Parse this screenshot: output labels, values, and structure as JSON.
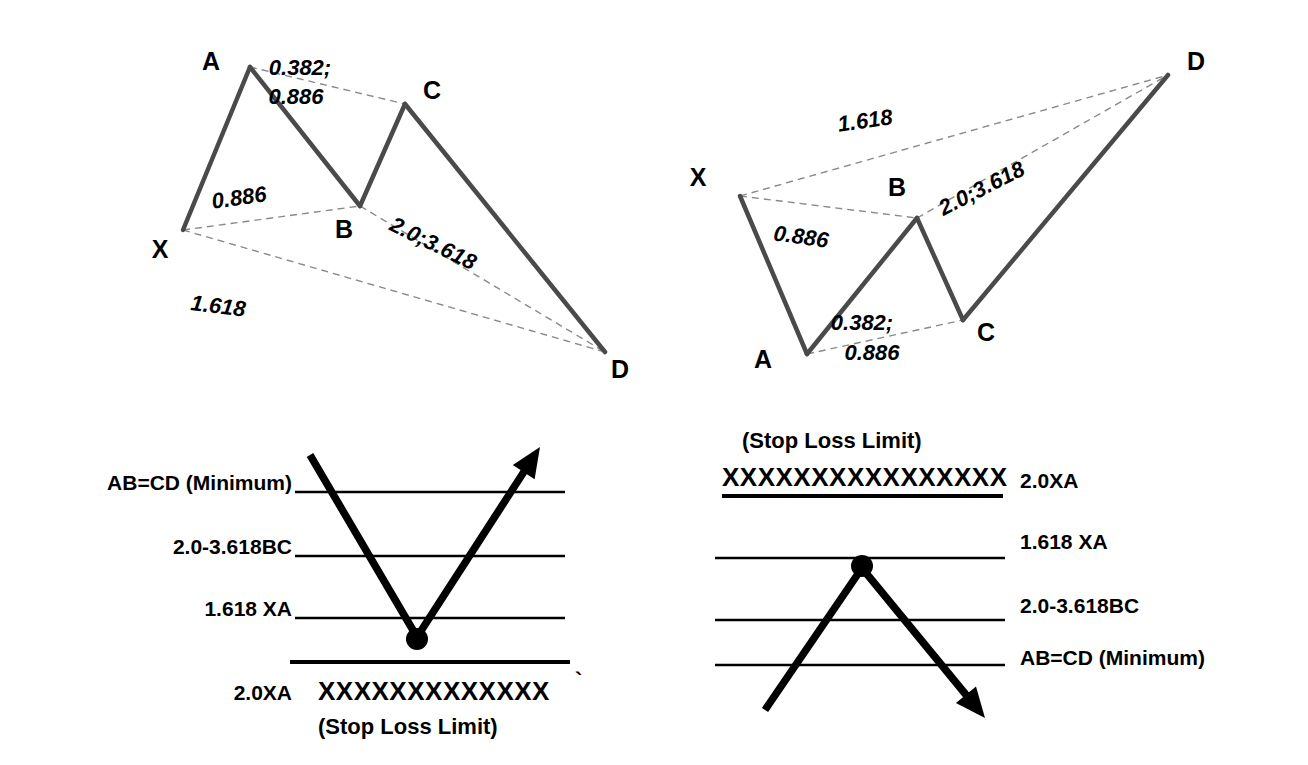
{
  "figure": {
    "background_color": "#ffffff",
    "ink_color": "#000000",
    "leg_color": "#4a4a4a",
    "projection_color": "#8a8a8a"
  },
  "patterns": {
    "bullish": {
      "name": "bullish-xabcd-pattern",
      "vertices": [
        {
          "id": "X",
          "label": "X",
          "x": 183,
          "y": 230,
          "label_x": 160,
          "label_y": 258
        },
        {
          "id": "A",
          "label": "A",
          "x": 250,
          "y": 67,
          "label_x": 211,
          "label_y": 70
        },
        {
          "id": "B",
          "label": "B",
          "x": 360,
          "y": 206,
          "label_x": 344,
          "label_y": 238
        },
        {
          "id": "C",
          "label": "C",
          "x": 405,
          "y": 104,
          "label_x": 432,
          "label_y": 99
        },
        {
          "id": "D",
          "label": "D",
          "x": 605,
          "y": 352,
          "label_x": 620,
          "label_y": 378
        }
      ],
      "ratios": [
        {
          "id": "AC",
          "text_line1": "0.382;",
          "text_line2": "0.886",
          "x": 300,
          "y": 75,
          "x2": 296,
          "y2": 104,
          "rotation": 0
        },
        {
          "id": "XB",
          "text_line1": "0.886",
          "text_line2": "",
          "x": 240,
          "y": 205,
          "x2": 0,
          "y2": 0,
          "rotation": -8
        },
        {
          "id": "BD",
          "text_line1": "2.0;3.618",
          "text_line2": "",
          "x": 430,
          "y": 250,
          "x2": 0,
          "y2": 0,
          "rotation": 26
        },
        {
          "id": "XD",
          "text_line1": "1.618",
          "text_line2": "",
          "x": 190,
          "y": 310,
          "x2": 0,
          "y2": 0,
          "rotation": 7
        }
      ]
    },
    "bearish": {
      "name": "bearish-xabcd-pattern",
      "vertices": [
        {
          "id": "X",
          "label": "X",
          "x": 740,
          "y": 196,
          "label_x": 698,
          "label_y": 186
        },
        {
          "id": "A",
          "label": "A",
          "x": 807,
          "y": 354,
          "label_x": 763,
          "label_y": 368
        },
        {
          "id": "B",
          "label": "B",
          "x": 917,
          "y": 218,
          "label_x": 897,
          "label_y": 196
        },
        {
          "id": "C",
          "label": "C",
          "x": 963,
          "y": 320,
          "label_x": 986,
          "label_y": 341
        },
        {
          "id": "D",
          "label": "D",
          "x": 1168,
          "y": 75,
          "label_x": 1196,
          "label_y": 70
        }
      ],
      "ratios": [
        {
          "id": "XD",
          "text_line1": "1.618",
          "text_line2": "",
          "x": 866,
          "y": 128,
          "x2": 0,
          "y2": 0,
          "rotation": -8
        },
        {
          "id": "XB",
          "text_line1": "0.886",
          "text_line2": "",
          "x": 800,
          "y": 244,
          "x2": 0,
          "y2": 0,
          "rotation": 8
        },
        {
          "id": "BD",
          "text_line1": "2.0;3.618",
          "text_line2": "",
          "x": 985,
          "y": 195,
          "x2": 0,
          "y2": 0,
          "rotation": -27
        },
        {
          "id": "AC",
          "text_line1": "0.382;",
          "text_line2": "0.886",
          "x": 862,
          "y": 330,
          "x2": 872,
          "y2": 360,
          "rotation": 0
        }
      ]
    }
  },
  "bullish_target_chart": {
    "name": "bullish-target-levels",
    "levels": [
      {
        "id": "abcd",
        "label": "AB=CD (Minimum)",
        "y": 492,
        "x1": 295,
        "x2": 565,
        "thick": false,
        "label_x": 292,
        "label_y": 490,
        "align": "end"
      },
      {
        "id": "bc",
        "label": "2.0-3.618BC",
        "y": 556,
        "x1": 295,
        "x2": 565,
        "thick": false,
        "label_x": 292,
        "label_y": 554,
        "align": "end"
      },
      {
        "id": "xa1618",
        "label": "1.618 XA",
        "y": 618,
        "x1": 295,
        "x2": 565,
        "thick": false,
        "label_x": 292,
        "label_y": 616,
        "align": "end"
      },
      {
        "id": "xa20",
        "label": "2.0XA",
        "y": 662,
        "x1": 290,
        "x2": 570,
        "thick": true,
        "label_x": 292,
        "label_y": 700,
        "align": "end"
      }
    ],
    "stop_marker": {
      "x_string": "XXXXXXXXXXXXX",
      "x": 318,
      "y": 700
    },
    "stop_caption": {
      "text": "(Stop Loss Limit)",
      "x": 318,
      "y": 734
    },
    "tick_mark": {
      "x": 575,
      "y": 688
    },
    "trend": {
      "start": {
        "x": 310,
        "y": 455
      },
      "pivot": {
        "x": 417,
        "y": 637
      },
      "end": {
        "x": 540,
        "y": 447
      },
      "dot": {
        "x": 417,
        "y": 639,
        "r": 11
      }
    }
  },
  "bearish_target_chart": {
    "name": "bearish-target-levels",
    "stop_caption": {
      "text": "(Stop Loss Limit)",
      "x": 742,
      "y": 448
    },
    "stop_marker": {
      "x_string": "XXXXXXXXXXXXXXXX",
      "x": 722,
      "y": 486
    },
    "stop_rule": {
      "y": 496,
      "x1": 722,
      "x2": 1003,
      "thick": true
    },
    "levels": [
      {
        "id": "xa20",
        "label": "2.0XA",
        "y": 496,
        "x1": 722,
        "x2": 1003,
        "thick": true,
        "label_x": 1020,
        "label_y": 488,
        "align": "start",
        "draw_line": false
      },
      {
        "id": "xa1618",
        "label": "1.618 XA",
        "y": 558,
        "x1": 715,
        "x2": 1005,
        "thick": false,
        "label_x": 1020,
        "label_y": 549,
        "align": "start",
        "draw_line": true
      },
      {
        "id": "bc",
        "label": "2.0-3.618BC",
        "y": 620,
        "x1": 715,
        "x2": 1005,
        "thick": false,
        "label_x": 1020,
        "label_y": 613,
        "align": "start",
        "draw_line": true
      },
      {
        "id": "abcd",
        "label": "AB=CD (Minimum)",
        "y": 665,
        "x1": 715,
        "x2": 1005,
        "thick": false,
        "label_x": 1020,
        "label_y": 665,
        "align": "start",
        "draw_line": true
      }
    ],
    "trend": {
      "start": {
        "x": 765,
        "y": 710
      },
      "pivot": {
        "x": 862,
        "y": 568
      },
      "end": {
        "x": 985,
        "y": 718
      },
      "dot": {
        "x": 862,
        "y": 566,
        "r": 11
      }
    }
  }
}
